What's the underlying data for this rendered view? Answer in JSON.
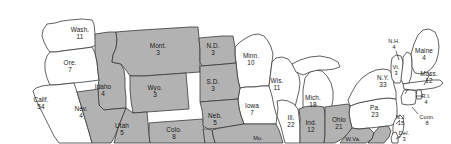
{
  "map": {
    "title": "United States Electoral College Map",
    "region": "continental-united-states-northern-portion",
    "colors": {
      "shaded_state_fill": "#b2b2b2",
      "unshaded_state_fill": "#ffffff",
      "border_stroke": "#3a3a3a",
      "label_text": "#1a1a1a",
      "background": "#ffffff"
    },
    "legend_note": "Shaded states are filled gray; unshaded states are white.",
    "states": [
      {
        "id": "WA",
        "name": "Wash.",
        "votes": "11",
        "shaded": false,
        "lx": 80,
        "ly": 34
      },
      {
        "id": "OR",
        "name": "Ore.",
        "votes": "7",
        "shaded": false,
        "lx": 70,
        "ly": 67
      },
      {
        "id": "CA",
        "name": "Calif.",
        "votes": "54",
        "shaded": false,
        "lx": 41,
        "ly": 104
      },
      {
        "id": "NV",
        "name": "Nev.",
        "votes": "4",
        "shaded": true,
        "lx": 81,
        "ly": 113
      },
      {
        "id": "ID",
        "name": "Idaho",
        "votes": "4",
        "shaded": true,
        "lx": 103,
        "ly": 91
      },
      {
        "id": "MT",
        "name": "Mont.",
        "votes": "3",
        "shaded": true,
        "lx": 158,
        "ly": 50
      },
      {
        "id": "WY",
        "name": "Wyo.",
        "votes": "3",
        "shaded": true,
        "lx": 155,
        "ly": 92
      },
      {
        "id": "UT",
        "name": "Utah",
        "votes": "5",
        "shaded": true,
        "lx": 122,
        "ly": 130
      },
      {
        "id": "CO",
        "name": "Colo.",
        "votes": "8",
        "shaded": true,
        "lx": 174,
        "ly": 134
      },
      {
        "id": "ND",
        "name": "N.D.",
        "votes": "3",
        "shaded": true,
        "lx": 213,
        "ly": 50
      },
      {
        "id": "SD",
        "name": "S.D.",
        "votes": "3",
        "shaded": true,
        "lx": 213,
        "ly": 86
      },
      {
        "id": "NE",
        "name": "Neb.",
        "votes": "5",
        "shaded": true,
        "lx": 215,
        "ly": 120
      },
      {
        "id": "MN",
        "name": "Minn.",
        "votes": "10",
        "shaded": false,
        "lx": 251,
        "ly": 60
      },
      {
        "id": "IA",
        "name": "Iowa",
        "votes": "7",
        "shaded": false,
        "lx": 252,
        "ly": 110
      },
      {
        "id": "MO",
        "name": "Mo.",
        "votes": "",
        "shaded": true,
        "lx": 258,
        "ly": 139
      },
      {
        "id": "WI",
        "name": "Wis.",
        "votes": "11",
        "shaded": false,
        "lx": 277,
        "ly": 85
      },
      {
        "id": "IL",
        "name": "Ill.",
        "votes": "22",
        "shaded": false,
        "lx": 291,
        "ly": 122
      },
      {
        "id": "MI",
        "name": "Mich.",
        "votes": "18",
        "shaded": false,
        "lx": 313,
        "ly": 102
      },
      {
        "id": "IN",
        "name": "Ind.",
        "votes": "12",
        "shaded": true,
        "lx": 311,
        "ly": 127
      },
      {
        "id": "OH",
        "name": "Ohio",
        "votes": "21",
        "shaded": true,
        "lx": 339,
        "ly": 124
      },
      {
        "id": "WV",
        "name": "W.Va.",
        "votes": "",
        "shaded": true,
        "lx": 353,
        "ly": 140
      },
      {
        "id": "PA",
        "name": "Pa.",
        "votes": "23",
        "shaded": false,
        "lx": 375,
        "ly": 112
      },
      {
        "id": "NY",
        "name": "N.Y.",
        "votes": "33",
        "shaded": false,
        "lx": 383,
        "ly": 82
      },
      {
        "id": "VT",
        "name": "Vt.",
        "votes": "3",
        "shaded": false,
        "lx": 396,
        "ly": 71
      },
      {
        "id": "NH",
        "name": "N.H.",
        "votes": "4",
        "shaded": false,
        "lx": 394,
        "ly": 45
      },
      {
        "id": "ME",
        "name": "Maine",
        "votes": "4",
        "shaded": false,
        "lx": 424,
        "ly": 55
      },
      {
        "id": "MA",
        "name": "Mass.",
        "votes": "12",
        "shaded": false,
        "lx": 429,
        "ly": 78
      },
      {
        "id": "RI",
        "name": "R.I.",
        "votes": "4",
        "shaded": false,
        "lx": 426,
        "ly": 100
      },
      {
        "id": "CT",
        "name": "Conn.",
        "votes": "8",
        "shaded": false,
        "lx": 427,
        "ly": 121
      },
      {
        "id": "NJ",
        "name": "N.J.",
        "votes": "15",
        "shaded": false,
        "lx": 401,
        "ly": 121
      },
      {
        "id": "DE",
        "name": "Del.",
        "votes": "3",
        "shaded": false,
        "lx": 404,
        "ly": 137
      }
    ]
  }
}
